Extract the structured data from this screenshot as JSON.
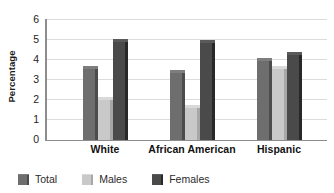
{
  "chart_data": {
    "type": "bar",
    "title": "",
    "subtitle": "",
    "xlabel": "",
    "ylabel": "Percentage",
    "categories": [
      "White",
      "African American",
      "Hispanic"
    ],
    "series": [
      {
        "name": "Total",
        "color": "#6e6e6e",
        "values": [
          3.7,
          3.5,
          4.1
        ]
      },
      {
        "name": "Males",
        "color": "#c9c9c9",
        "values": [
          2.15,
          1.75,
          3.7
        ]
      },
      {
        "name": "Females",
        "color": "#4a4a4a",
        "values": [
          5.05,
          5.0,
          4.4
        ]
      }
    ],
    "ylim": [
      0,
      6
    ],
    "y_ticks": [
      0,
      1,
      2,
      3,
      4,
      5,
      6
    ],
    "y_tick_labels": [
      "0",
      "1",
      "2",
      "3",
      "4",
      "5",
      "6"
    ],
    "grid": true,
    "grid_axis": "y",
    "legend_position": "bottom-left",
    "bar_style": "3d-shaded",
    "annotations": []
  },
  "axes": {
    "y_title": "Percentage",
    "y_tick_labels": [
      "6",
      "5",
      "4",
      "3",
      "2",
      "1",
      "0"
    ]
  },
  "legend": {
    "entries": [
      {
        "label": "Total",
        "color": "#6e6e6e"
      },
      {
        "label": "Males",
        "color": "#c9c9c9"
      },
      {
        "label": "Females",
        "color": "#4a4a4a"
      }
    ]
  },
  "colors": {
    "total": "#6e6e6e",
    "males": "#c9c9c9",
    "females": "#4a4a4a",
    "axis": "#8d8d8d",
    "grid": "#dcdcdc",
    "text": "#1a1a1a",
    "background": "#ffffff"
  }
}
